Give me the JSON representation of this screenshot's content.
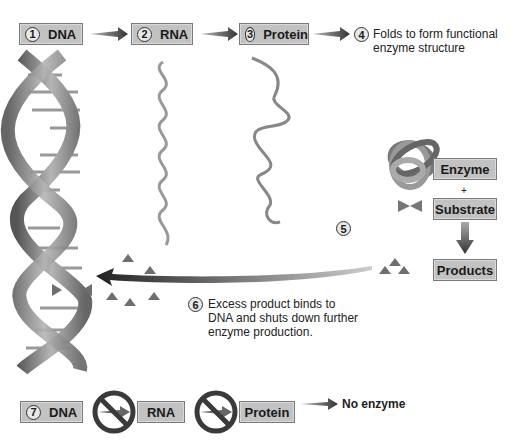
{
  "flow": {
    "steps": [
      {
        "num": "1",
        "label": "DNA"
      },
      {
        "num": "2",
        "label": "RNA"
      },
      {
        "num": "3",
        "label": "Protein"
      },
      {
        "num": "4",
        "label": "Folds to form functional enzyme structure",
        "line1": "Folds to form functional",
        "line2": "enzyme structure"
      }
    ]
  },
  "reaction": {
    "step_num": "5",
    "enzyme": "Enzyme",
    "plus": "+",
    "substrate": "Substrate",
    "products": "Products"
  },
  "feedback": {
    "step_num": "6",
    "line1": "Excess product binds to",
    "line2": "DNA and shuts down further",
    "line3": "enzyme production."
  },
  "blocked": {
    "step_num": "7",
    "dna": "DNA",
    "rna": "RNA",
    "protein": "Protein",
    "result": "No enzyme"
  },
  "colors": {
    "box_fill": "#c2c2c2",
    "arrow": "#444444",
    "triangle": "#6e6e6e",
    "helix": "#8a8a8a"
  }
}
